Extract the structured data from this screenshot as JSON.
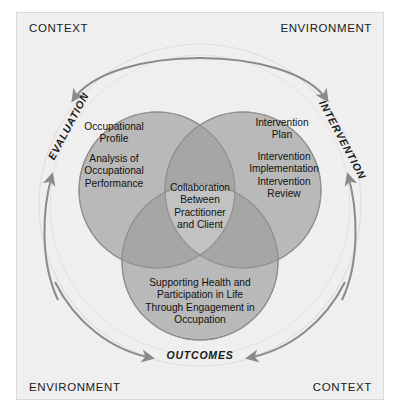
{
  "diagram": {
    "corners": {
      "top_left": "CONTEXT",
      "top_right": "ENVIRONMENT",
      "bottom_left": "ENVIRONMENT",
      "bottom_right": "CONTEXT"
    },
    "phases": {
      "evaluation": "EVALUATION",
      "intervention": "INTERVENTION",
      "outcomes": "OUTCOMES"
    },
    "circles": {
      "left": {
        "name": "evaluation-circle",
        "line_1": "Occupational\nProfile",
        "line_2": "Analysis of\nOccupational\nPerformance"
      },
      "right": {
        "name": "intervention-circle",
        "line_1": "Intervention\nPlan",
        "line_2": "Intervention\nImplementation\nIntervention\nReview"
      },
      "bottom": {
        "name": "outcomes-circle",
        "text": "Supporting Health and\nParticipation in Life\nThrough Engagement in\nOccupation"
      },
      "center": {
        "name": "collaboration-overlap",
        "text": "Collaboration\nBetween\nPractitioner\nand Client"
      }
    },
    "colors": {
      "panel_background": "#efefef",
      "circle_fill": "#b9b9b9",
      "circle_stroke": "#8e8e8e",
      "pair_overlap": "#a8a8a8",
      "center_overlap": "#c2c2c2",
      "arrow": "#8a8a8a",
      "text": "#111111"
    }
  }
}
